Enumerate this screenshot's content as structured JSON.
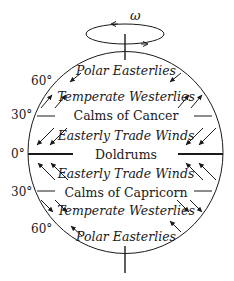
{
  "diagram": {
    "rotation_symbol": "ω",
    "colors": {
      "stroke": "#1a1a1a",
      "background": "#ffffff"
    },
    "latitude_labels": {
      "n60": "60°",
      "n30": "30°",
      "eq": "0°",
      "s30": "30°",
      "s60": "60°"
    },
    "zones": {
      "north_polar": "Polar Easterlies",
      "north_temperate": "Temperate Westerlies",
      "north_calms": "Calms of Cancer",
      "north_trade": "Easterly Trade Winds",
      "equator": "Doldrums",
      "south_trade": "Easterly Trade Winds",
      "south_calms": "Calms of Capricorn",
      "south_temperate": "Temperate Westerlies",
      "south_polar": "Polar Easterlies"
    },
    "wind_arrows": {
      "north_polar": "southwest",
      "north_temperate": "northeast",
      "north_trade": "southwest",
      "south_trade": "northwest",
      "south_temperate": "southeast",
      "south_polar": "northwest"
    }
  }
}
